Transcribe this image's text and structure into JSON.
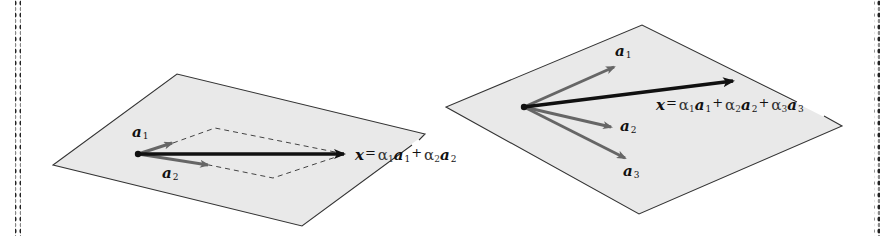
{
  "colors": {
    "plane_fill": "#e9e9e9",
    "plane_stroke": "#333333",
    "x_vector": "#111111",
    "basis_vector": "#666666",
    "dashed": "#444444",
    "border_dots": "#222222"
  },
  "left_panel": {
    "plane": {
      "points": "177,74 425,134 302,226 53,165"
    },
    "vectors": [
      {
        "id": "a1",
        "label": "a",
        "sub": "1"
      },
      {
        "id": "a2",
        "label": "a",
        "sub": "2"
      }
    ],
    "equation": {
      "lhs": "x",
      "eq": "=",
      "terms": [
        {
          "coef": "α",
          "coef_sub": "1",
          "vec": "a",
          "vec_sub": "1"
        },
        {
          "op": "+",
          "coef": "α",
          "coef_sub": "2",
          "vec": "a",
          "vec_sub": "2"
        }
      ]
    }
  },
  "right_panel": {
    "plane": {
      "points": "642,25 842,126 639,214 446,107"
    },
    "vectors": [
      {
        "id": "a1",
        "label": "a",
        "sub": "1"
      },
      {
        "id": "a2",
        "label": "a",
        "sub": "2"
      },
      {
        "id": "a3",
        "label": "a",
        "sub": "3"
      }
    ],
    "equation": {
      "lhs": "x",
      "eq": "=",
      "terms": [
        {
          "coef": "α",
          "coef_sub": "1",
          "vec": "a",
          "vec_sub": "1"
        },
        {
          "op": "+",
          "coef": "α",
          "coef_sub": "2",
          "vec": "a",
          "vec_sub": "2"
        },
        {
          "op": "+",
          "coef": "α",
          "coef_sub": "3",
          "vec": "a",
          "vec_sub": "3"
        }
      ]
    }
  }
}
